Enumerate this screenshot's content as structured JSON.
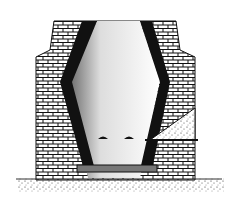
{
  "illustration": {
    "subject": "brick furnace cross-section",
    "colors": {
      "brick_fill": "#ffffff",
      "mortar": "#111111",
      "lining": "#111111",
      "ground": "#555555",
      "background": "#ffffff"
    }
  }
}
